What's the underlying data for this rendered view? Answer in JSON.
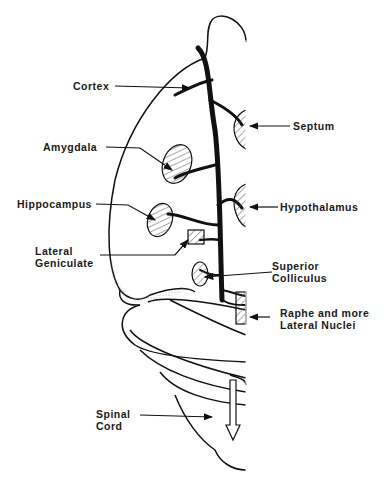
{
  "diagram": {
    "type": "anatomical-pathway",
    "labels": {
      "cortex": "Cortex",
      "amygdala": "Amygdala",
      "hippocampus": "Hippocampus",
      "lateral_geniculate_1": "Lateral",
      "lateral_geniculate_2": "Geniculate",
      "septum": "Septum",
      "hypothalamus": "Hypothalamus",
      "superior_colliculus_1": "Superior",
      "superior_colliculus_2": "Colliculus",
      "raphe_1": "Raphe and more",
      "raphe_2": "Lateral Nuclei",
      "spinal_cord_1": "Spinal",
      "spinal_cord_2": "Cord"
    },
    "colors": {
      "ink": "#111111",
      "background": "#ffffff",
      "hatch": "#555555"
    }
  }
}
